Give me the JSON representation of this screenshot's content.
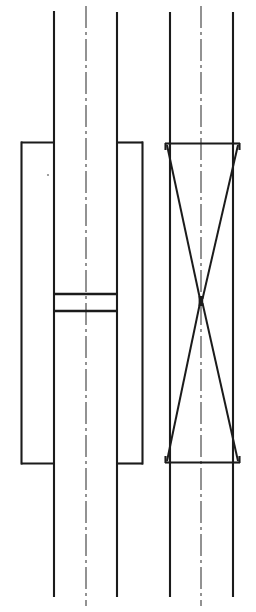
{
  "document": {
    "kind": "engineering-line-drawing",
    "title": "Sectional Assembly Drawing",
    "sheet_width": 256,
    "sheet_height": 612,
    "background_color": "#ffffff",
    "line_color": "#1b1b1b",
    "centerline_color": "#3a3a3a",
    "visible_text": "",
    "labels": [],
    "annotations": []
  },
  "figures": [
    {
      "id": "figure-left",
      "name": "left-section-view",
      "description": "Rectangular housing body with two long vertical shafts passing through and two horizontal cross rungs near mid-height",
      "centerline": {
        "x": 86,
        "y_top": 6,
        "y_bottom": 606
      },
      "shafts": [
        {
          "name": "shaft-outer-left",
          "x": 54,
          "y_top": 11,
          "y_bottom": 597
        },
        {
          "name": "shaft-outer-right",
          "x": 117,
          "y_top": 12,
          "y_bottom": 597
        }
      ],
      "housing": {
        "name": "housing-rect",
        "x1": 21,
        "y1": 142,
        "x2": 143,
        "y2": 464
      },
      "rungs": [
        {
          "name": "cross-rung-upper",
          "x1": 54,
          "x2": 117,
          "y": 294
        },
        {
          "name": "cross-rung-lower",
          "x1": 54,
          "x2": 117,
          "y": 311
        }
      ],
      "speck": {
        "x": 48,
        "y": 175,
        "r": 1.1
      }
    },
    {
      "id": "figure-right",
      "name": "right-section-view",
      "description": "Rectangular frame with two long vertical shafts and an internal X crossing (hourglass) formed by two diagonals meeting at a narrow waist at the centre",
      "centerline": {
        "x": 201,
        "y_top": 6,
        "y_bottom": 606
      },
      "shafts": [
        {
          "name": "shaft-outer-left",
          "x": 170,
          "y_top": 12,
          "y_bottom": 597
        },
        {
          "name": "shaft-outer-right",
          "x": 233,
          "y_top": 12,
          "y_bottom": 597
        }
      ],
      "frame": {
        "name": "frame-top-edge",
        "x1": 165,
        "x2": 240,
        "y": 143
      },
      "frame_bottom": {
        "name": "frame-bottom-edge",
        "x1": 165,
        "x2": 240,
        "y": 463
      },
      "diagonals": [
        {
          "name": "diagonal-upper-left-to-waist",
          "x1": 167,
          "y1": 145,
          "x2": 200,
          "y2": 299
        },
        {
          "name": "diagonal-upper-right-to-waist",
          "x1": 238,
          "y1": 145,
          "x2": 202,
          "y2": 299
        },
        {
          "name": "diagonal-waist-to-lower-left",
          "x1": 200,
          "y1": 303,
          "x2": 167,
          "y2": 461
        },
        {
          "name": "diagonal-waist-to-lower-right",
          "x1": 202,
          "y1": 303,
          "x2": 238,
          "y2": 461
        }
      ],
      "waist": {
        "name": "crossing-waist",
        "x": 201,
        "y": 301
      }
    }
  ],
  "style": {
    "solid_line_width": 2.1,
    "centerline_width": 1.1,
    "centerline_dash": "22 4 3 4"
  }
}
